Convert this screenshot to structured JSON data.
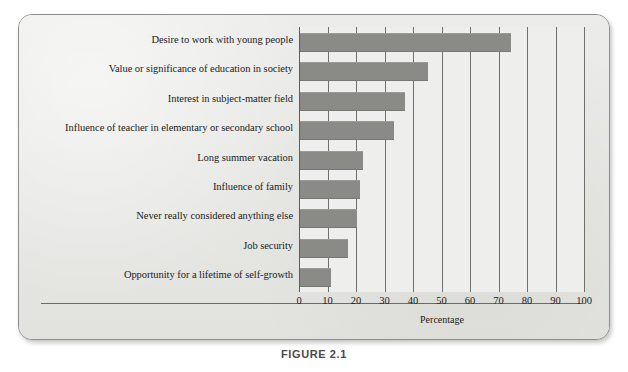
{
  "figure": {
    "caption": "FIGURE 2.1",
    "background_color": "#e9e9e6",
    "bar_color": "#8a8a87",
    "grid_color": "#6f6f6c",
    "text_color": "#1c1c1c"
  },
  "chart_data": {
    "type": "bar",
    "orientation": "horizontal",
    "title": "",
    "xlabel": "Percentage",
    "ylabel": "",
    "xlim": [
      0,
      100
    ],
    "grid": true,
    "legend": null,
    "categories": [
      "Desire to work with young people",
      "Value or significance of education in society",
      "Interest in subject-matter field",
      "Influence of teacher in elementary or secondary school",
      "Long summer vacation",
      "Influence of family",
      "Never really considered anything else",
      "Job security",
      "Opportunity for a lifetime of self-growth"
    ],
    "values": [
      74,
      45,
      37,
      33,
      22,
      21,
      20,
      17,
      11
    ],
    "xticks": [
      0,
      10,
      20,
      30,
      40,
      50,
      60,
      70,
      80,
      90,
      100
    ],
    "xtick_labels": [
      "0",
      "10",
      "20",
      "30",
      "40",
      "50",
      "60",
      "70",
      "80",
      "90",
      "100"
    ]
  }
}
